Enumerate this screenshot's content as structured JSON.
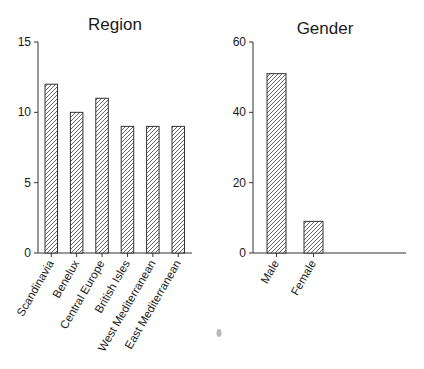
{
  "chart_data": [
    {
      "type": "bar",
      "title": "Region",
      "categories": [
        "Scandinavia",
        "Benelux",
        "Central Europe",
        "British Isles",
        "West Mediterranean",
        "East Mediterranean"
      ],
      "values": [
        12,
        10,
        11,
        9,
        9,
        9
      ],
      "xlabel": "",
      "ylabel": "",
      "ylim": [
        0,
        15
      ],
      "yticks": [
        0,
        5,
        10,
        15
      ],
      "grid": false,
      "legend": "none",
      "bar_fill": "diagonal-hatch"
    },
    {
      "type": "bar",
      "title": "Gender",
      "categories": [
        "Male",
        "Female"
      ],
      "values": [
        51,
        9
      ],
      "xlabel": "",
      "ylabel": "",
      "ylim": [
        0,
        60
      ],
      "yticks": [
        0,
        20,
        40,
        60
      ],
      "grid": false,
      "legend": "none",
      "bar_fill": "diagonal-hatch"
    }
  ],
  "colors": {
    "axis": "#333333",
    "hatch": "#555555",
    "text": "#1a1a1a",
    "artifact": "#9a9a9a"
  }
}
